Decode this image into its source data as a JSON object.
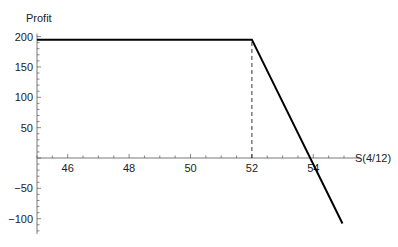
{
  "chart_data": {
    "type": "line",
    "title": "",
    "xlabel": "S(4/12)",
    "ylabel": "Profit",
    "xlim": [
      45,
      55.2
    ],
    "ylim": [
      -125,
      205
    ],
    "x_ticks": [
      46,
      48,
      50,
      52,
      54
    ],
    "x_minor_step": 0.5,
    "y_ticks": [
      -100,
      -50,
      50,
      100,
      150,
      200
    ],
    "y_minor_step": 10,
    "grid": false,
    "legend": null,
    "series": [
      {
        "name": "Profit",
        "x": [
          45,
          52,
          54.95
        ],
        "y": [
          195,
          195,
          -108
        ],
        "color": "#000000"
      }
    ],
    "annotations": [
      {
        "type": "dashed-vertical-line",
        "x": 52,
        "from_y": 0,
        "to_y": 195,
        "color": "#000000"
      }
    ]
  },
  "labels": {
    "xlabel": "S(4/12)",
    "ylabel": "Profit"
  }
}
